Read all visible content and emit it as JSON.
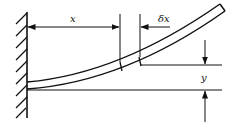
{
  "diagram": {
    "labels": {
      "x": "x",
      "dx": "δx",
      "y": "y"
    },
    "colors": {
      "line": "#111111",
      "background": "#ffffff"
    }
  }
}
